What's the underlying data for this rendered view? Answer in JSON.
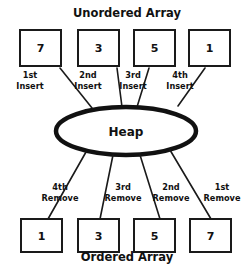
{
  "diagram": {
    "type": "heap-sort-flow-diagram",
    "top_title": "Unordered Array",
    "bottom_title": "Ordered Array",
    "center_node": {
      "label": "Heap",
      "shape": "ellipse"
    },
    "unordered_array": {
      "title": "Unordered Array",
      "values": [
        "7",
        "3",
        "5",
        "1"
      ]
    },
    "ordered_array": {
      "title": "Ordered Array",
      "values": [
        "1",
        "3",
        "5",
        "7"
      ]
    },
    "insert_operations": [
      {
        "ordinal": "1st",
        "action": "Insert"
      },
      {
        "ordinal": "2nd",
        "action": "Insert"
      },
      {
        "ordinal": "3rd",
        "action": "Insert"
      },
      {
        "ordinal": "4th",
        "action": "Insert"
      }
    ],
    "remove_operations": [
      {
        "ordinal": "4th",
        "action": "Remove"
      },
      {
        "ordinal": "3rd",
        "action": "Remove"
      },
      {
        "ordinal": "2nd",
        "action": "Remove"
      },
      {
        "ordinal": "1st",
        "action": "Remove"
      }
    ],
    "colors": {
      "background": "#ffffff",
      "stroke": "#1a1a1a",
      "text": "#111111"
    }
  }
}
